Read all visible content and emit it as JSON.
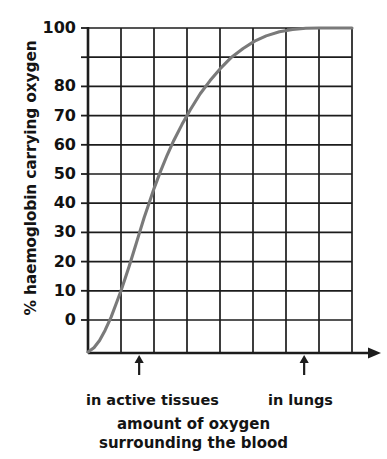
{
  "chart_data": {
    "type": "line",
    "title": "",
    "subtitle": "",
    "ylabel": "% haemoglobin carrying oxygen",
    "xlabel_line1": "amount of oxygen",
    "xlabel_line2": "surrounding the blood",
    "ylim": [
      -12,
      100
    ],
    "ytick_values": [
      100,
      90,
      80,
      70,
      60,
      50,
      40,
      30,
      20,
      10,
      0
    ],
    "ytick_labels": [
      "100",
      "",
      "80",
      "70",
      "60",
      "50",
      "40",
      "30",
      "20",
      "10",
      "0"
    ],
    "xlim": [
      0,
      8
    ],
    "xtick_values": [
      0,
      1,
      2,
      3,
      4,
      5,
      6,
      7,
      8
    ],
    "xtick_labels": [
      "",
      "",
      "",
      "",
      "",
      "",
      "",
      "",
      ""
    ],
    "grid": true,
    "legend": null,
    "series": [
      {
        "name": "oxygen dissociation curve",
        "color": "#7a7a7a",
        "x": [
          0.0,
          0.18,
          0.35,
          0.52,
          0.7,
          0.85,
          1.0,
          1.12,
          1.25,
          1.4,
          1.55,
          1.7,
          1.85,
          2.0,
          2.2,
          2.4,
          2.6,
          2.85,
          3.1,
          3.4,
          3.7,
          4.0,
          4.35,
          4.7,
          5.05,
          5.4,
          5.8,
          6.2,
          6.6,
          7.0,
          7.5,
          8.0
        ],
        "y": [
          -11.0,
          -9.5,
          -7.0,
          -3.5,
          1.0,
          5.5,
          10.0,
          14.0,
          18.5,
          24.0,
          29.5,
          35.0,
          40.0,
          45.0,
          51.0,
          56.5,
          61.5,
          67.0,
          72.0,
          77.5,
          82.0,
          86.0,
          90.0,
          93.0,
          95.5,
          97.3,
          98.7,
          99.5,
          99.9,
          100.0,
          100.0,
          100.0
        ]
      }
    ],
    "annotations": [
      {
        "name": "in-active-tissues-marker",
        "label": "in active tissues",
        "x": 1.55,
        "marker": "up-arrow"
      },
      {
        "name": "in-lungs-marker",
        "label": "in lungs",
        "x": 6.55,
        "marker": "up-arrow"
      }
    ],
    "axis_style": {
      "x_axis_has_arrowhead": true,
      "grid_color": "#1c1c1c",
      "curve_color": "#7d7d7d",
      "background": "#ffffff"
    }
  }
}
